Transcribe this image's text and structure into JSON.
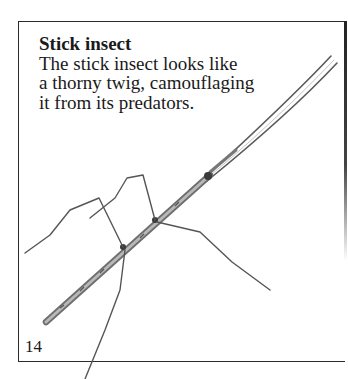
{
  "caption": {
    "title": "Stick insect",
    "lines": [
      "The stick insect looks like",
      "a thorny twig, camouflaging",
      "it from its predators."
    ]
  },
  "page": {
    "number": "14"
  },
  "illustration": {
    "subject": "stick-insect-drawing",
    "colors": {
      "body": "#8a8a8a",
      "outline": "#3a3a3a",
      "legs": "#555555"
    }
  }
}
